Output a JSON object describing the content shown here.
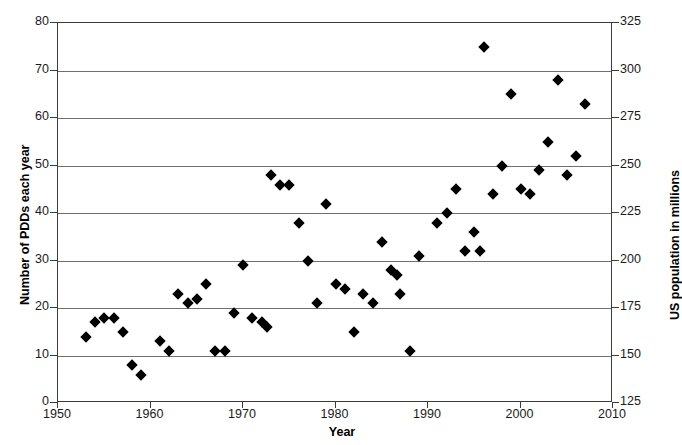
{
  "chart_data": {
    "type": "scatter",
    "title": "",
    "xlabel": "Year",
    "ylabel": "Number of PDDs each year",
    "y2label": "US population in millions",
    "xlim": [
      1950,
      2010
    ],
    "ylim": [
      0,
      80
    ],
    "y2lim": [
      125,
      325
    ],
    "xticks": [
      1950,
      1960,
      1970,
      1980,
      1990,
      2000,
      2010
    ],
    "yticks": [
      0,
      10,
      20,
      30,
      40,
      50,
      60,
      70,
      80
    ],
    "y2ticks": [
      125,
      150,
      175,
      200,
      225,
      250,
      275,
      300,
      325
    ],
    "grid": "horizontal",
    "legend": "none",
    "series": [
      {
        "name": "Number of PDDs each year",
        "marker": "diamond",
        "color": "#000000",
        "points": [
          [
            1953,
            14
          ],
          [
            1954,
            17
          ],
          [
            1955,
            18
          ],
          [
            1956,
            18
          ],
          [
            1957,
            15
          ],
          [
            1958,
            8
          ],
          [
            1959,
            6
          ],
          [
            1961,
            13
          ],
          [
            1962,
            11
          ],
          [
            1963,
            23
          ],
          [
            1964,
            21
          ],
          [
            1965,
            22
          ],
          [
            1966,
            25
          ],
          [
            1967,
            11
          ],
          [
            1968,
            11
          ],
          [
            1969,
            19
          ],
          [
            1970,
            29
          ],
          [
            1971,
            18
          ],
          [
            1972,
            17
          ],
          [
            1972.6,
            16
          ],
          [
            1973,
            48
          ],
          [
            1974,
            46
          ],
          [
            1975,
            46
          ],
          [
            1976,
            38
          ],
          [
            1977,
            30
          ],
          [
            1978,
            21
          ],
          [
            1979,
            42
          ],
          [
            1980,
            25
          ],
          [
            1981,
            24
          ],
          [
            1982,
            15
          ],
          [
            1983,
            23
          ],
          [
            1984,
            21
          ],
          [
            1985,
            34
          ],
          [
            1986,
            28
          ],
          [
            1986.7,
            27
          ],
          [
            1987,
            23
          ],
          [
            1988,
            11
          ],
          [
            1989,
            31
          ],
          [
            1991,
            38
          ],
          [
            1992,
            40
          ],
          [
            1993,
            45
          ],
          [
            1994,
            32
          ],
          [
            1995,
            36
          ],
          [
            1995.6,
            32
          ],
          [
            1996,
            75
          ],
          [
            1997,
            44
          ],
          [
            1998,
            50
          ],
          [
            1999,
            65
          ],
          [
            2000,
            45
          ],
          [
            2001,
            44
          ],
          [
            2002,
            49
          ],
          [
            2003,
            55
          ],
          [
            2004,
            68
          ],
          [
            2005,
            48
          ],
          [
            2006,
            52
          ],
          [
            2007,
            63
          ]
        ]
      }
    ]
  },
  "axes": {
    "x": {
      "label": "Year",
      "tick_labels": [
        "1950",
        "1960",
        "1970",
        "1980",
        "1990",
        "2000",
        "2010"
      ]
    },
    "y_left": {
      "label": "Number of PDDs each year",
      "tick_labels": [
        "0",
        "10",
        "20",
        "30",
        "40",
        "50",
        "60",
        "70",
        "80"
      ]
    },
    "y_right": {
      "label": "US population in millions",
      "tick_labels": [
        "125",
        "150",
        "175",
        "200",
        "225",
        "250",
        "275",
        "300",
        "325"
      ]
    }
  },
  "colors": {
    "marker": "#000000",
    "gridline": "#6f6f6f",
    "frame": "#3b3b3b",
    "background": "#ffffff"
  }
}
